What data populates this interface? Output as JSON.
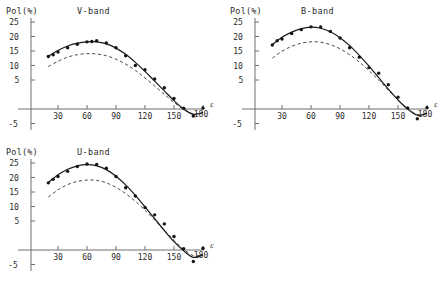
{
  "figure": {
    "background": "#ffffff",
    "ink": "#1a1a1a",
    "axis_color": "#6f6f6f",
    "curve_color": "#1d1d1d",
    "dashed_color": "#4a4a4a",
    "point_color": "#141414"
  },
  "panels": [
    {
      "id": "v-band",
      "title": "V-band",
      "ylabel": "Pol(%)",
      "xlabel": "ε"
    },
    {
      "id": "b-band",
      "title": "B-band",
      "ylabel": "Pol(%)",
      "xlabel": "ε"
    },
    {
      "id": "u-band",
      "title": "U-band",
      "ylabel": "Pol(%)",
      "xlabel": "ε"
    }
  ],
  "chart_data": [
    {
      "type": "scatter",
      "id": "v-band",
      "title": "V-band",
      "xlabel": "ε",
      "ylabel": "Pol(%)",
      "xlim": [
        0,
        190
      ],
      "ylim": [
        -5,
        25
      ],
      "xticks": [
        30,
        60,
        90,
        120,
        150,
        180
      ],
      "yticks": [
        -5,
        5,
        10,
        15,
        20,
        25
      ],
      "grid": false,
      "legend": null,
      "series": [
        {
          "name": "observed points",
          "style": "points",
          "x": [
            20,
            25,
            30,
            40,
            50,
            60,
            65,
            70,
            80,
            90,
            100,
            110,
            120,
            130,
            140,
            150,
            160,
            170,
            180
          ],
          "y": [
            15.1,
            15.6,
            16.4,
            17.6,
            18.6,
            19.3,
            19.4,
            19.6,
            19.0,
            17.6,
            15.3,
            12.5,
            11.3,
            8.6,
            6.1,
            3.0,
            0.2,
            -2.0,
            0.3
          ]
        },
        {
          "name": "model fit (solid)",
          "style": "solid-line",
          "x": [
            20,
            30,
            40,
            50,
            60,
            70,
            80,
            90,
            100,
            110,
            120,
            130,
            140,
            150,
            160,
            170,
            180
          ],
          "y": [
            15.2,
            16.8,
            18.1,
            18.9,
            19.3,
            19.3,
            18.7,
            17.5,
            15.7,
            13.4,
            10.8,
            8.0,
            5.2,
            2.4,
            0.0,
            -1.5,
            -1.0
          ]
        },
        {
          "name": "comparison model (dashed)",
          "style": "dashed-line",
          "x": [
            20,
            30,
            40,
            50,
            60,
            70,
            80,
            90,
            100,
            110,
            120,
            130,
            140,
            150,
            160,
            170,
            180
          ],
          "y": [
            12.2,
            13.7,
            14.9,
            15.6,
            15.9,
            15.8,
            15.3,
            14.3,
            12.9,
            11.1,
            8.9,
            6.6,
            4.2,
            1.9,
            -0.1,
            -1.4,
            -1.2
          ]
        }
      ]
    },
    {
      "type": "scatter",
      "id": "b-band",
      "title": "B-band",
      "xlabel": "ε",
      "ylabel": "Pol(%)",
      "xlim": [
        0,
        190
      ],
      "ylim": [
        -5,
        25
      ],
      "xticks": [
        30,
        60,
        90,
        120,
        150,
        180
      ],
      "yticks": [
        -5,
        5,
        10,
        15,
        20,
        25
      ],
      "grid": false,
      "legend": null,
      "series": [
        {
          "name": "observed points",
          "style": "points",
          "x": [
            20,
            25,
            30,
            40,
            50,
            60,
            70,
            80,
            90,
            100,
            110,
            120,
            130,
            140,
            150,
            160,
            170,
            180
          ],
          "y": [
            18.4,
            19.6,
            20.1,
            21.7,
            22.8,
            23.6,
            23.6,
            22.3,
            20.4,
            17.6,
            14.9,
            11.9,
            10.3,
            7.0,
            3.4,
            0.3,
            -2.8,
            0.4
          ]
        },
        {
          "name": "model fit (solid)",
          "style": "solid-line",
          "x": [
            20,
            30,
            40,
            50,
            60,
            70,
            80,
            90,
            100,
            110,
            120,
            130,
            140,
            150,
            160,
            170,
            180
          ],
          "y": [
            18.5,
            20.6,
            22.1,
            23.1,
            23.5,
            23.2,
            22.2,
            20.5,
            18.2,
            15.4,
            12.3,
            9.0,
            5.7,
            2.6,
            0.0,
            -1.8,
            -1.2
          ]
        },
        {
          "name": "comparison model (dashed)",
          "style": "dashed-line",
          "x": [
            20,
            30,
            40,
            50,
            60,
            70,
            80,
            90,
            100,
            110,
            120,
            130,
            140,
            150,
            160,
            170,
            180
          ],
          "y": [
            14.6,
            16.6,
            18.0,
            18.9,
            19.3,
            19.2,
            18.5,
            17.3,
            15.6,
            13.5,
            11.0,
            8.3,
            5.4,
            2.6,
            0.1,
            -1.6,
            -1.3
          ]
        }
      ]
    },
    {
      "type": "scatter",
      "id": "u-band",
      "title": "U-band",
      "xlabel": "ε",
      "ylabel": "Pol(%)",
      "xlim": [
        0,
        190
      ],
      "ylim": [
        -5,
        25
      ],
      "xticks": [
        30,
        60,
        90,
        120,
        150,
        180
      ],
      "yticks": [
        -5,
        5,
        10,
        15,
        20,
        25
      ],
      "grid": false,
      "legend": null,
      "series": [
        {
          "name": "observed points",
          "style": "points",
          "x": [
            20,
            25,
            30,
            40,
            50,
            60,
            70,
            80,
            90,
            100,
            110,
            120,
            130,
            140,
            150,
            160,
            170,
            180
          ],
          "y": [
            19.3,
            20.3,
            21.1,
            22.6,
            24.0,
            24.7,
            24.6,
            23.5,
            21.1,
            17.9,
            15.5,
            12.2,
            10.1,
            7.5,
            3.9,
            0.4,
            -3.3,
            0.5
          ]
        },
        {
          "name": "model fit (solid)",
          "style": "solid-line",
          "x": [
            20,
            30,
            40,
            50,
            60,
            70,
            80,
            90,
            100,
            110,
            120,
            130,
            140,
            150,
            160,
            170,
            180
          ],
          "y": [
            19.4,
            21.6,
            23.2,
            24.2,
            24.5,
            24.2,
            23.1,
            21.2,
            18.7,
            15.7,
            12.4,
            9.0,
            5.6,
            2.4,
            -0.2,
            -2.1,
            -1.4
          ]
        },
        {
          "name": "comparison model (dashed)",
          "style": "dashed-line",
          "x": [
            20,
            30,
            40,
            50,
            60,
            70,
            80,
            90,
            100,
            110,
            120,
            130,
            140,
            150,
            160,
            170,
            180
          ],
          "y": [
            15.2,
            17.3,
            18.8,
            19.7,
            20.1,
            20.0,
            19.3,
            18.0,
            16.2,
            14.0,
            11.4,
            8.6,
            5.7,
            2.8,
            0.2,
            -1.6,
            -1.4
          ]
        }
      ]
    }
  ]
}
